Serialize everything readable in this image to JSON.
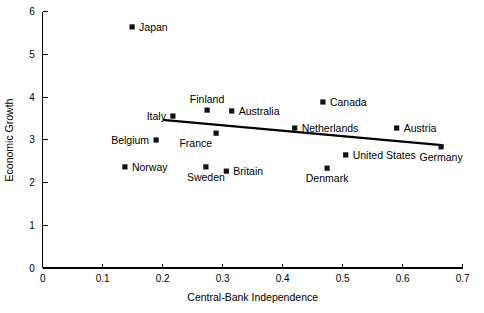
{
  "chart_data": {
    "type": "scatter",
    "title": "",
    "xlabel": "Central-Bank Independence",
    "ylabel": "Economic Growth",
    "xlim": [
      0,
      0.7
    ],
    "ylim": [
      0,
      6
    ],
    "grid": false,
    "legend": "none",
    "x_ticks": [
      "0",
      "0.1",
      "0.2",
      "0.3",
      "0.4",
      "0.5",
      "0.6",
      "0.7"
    ],
    "x_tick_values": [
      0,
      0.1,
      0.2,
      0.3,
      0.4,
      0.5,
      0.6,
      0.7
    ],
    "y_ticks": [
      "0",
      "1",
      "2",
      "3",
      "4",
      "5",
      "6"
    ],
    "y_tick_values": [
      0,
      1,
      2,
      3,
      4,
      5,
      6
    ],
    "marker_shape": "square",
    "marker_color": "#111111",
    "points": [
      {
        "label": "Japan",
        "x": 0.149,
        "y": 5.65,
        "label_pos": "right"
      },
      {
        "label": "Canada",
        "x": 0.467,
        "y": 3.89,
        "label_pos": "right"
      },
      {
        "label": "Finland",
        "x": 0.274,
        "y": 3.7,
        "label_pos": "above"
      },
      {
        "label": "Australia",
        "x": 0.315,
        "y": 3.68,
        "label_pos": "right"
      },
      {
        "label": "Italy",
        "x": 0.217,
        "y": 3.56,
        "label_pos": "left"
      },
      {
        "label": "Netherlands",
        "x": 0.42,
        "y": 3.28,
        "label_pos": "right"
      },
      {
        "label": "Austria",
        "x": 0.59,
        "y": 3.28,
        "label_pos": "right"
      },
      {
        "label": "France",
        "x": 0.289,
        "y": 3.16,
        "label_pos": "below-left"
      },
      {
        "label": "Belgium",
        "x": 0.189,
        "y": 3.0,
        "label_pos": "left"
      },
      {
        "label": "Germany",
        "x": 0.664,
        "y": 2.84,
        "label_pos": "below"
      },
      {
        "label": "United States",
        "x": 0.505,
        "y": 2.65,
        "label_pos": "right"
      },
      {
        "label": "Norway",
        "x": 0.137,
        "y": 2.37,
        "label_pos": "right"
      },
      {
        "label": "Sweden",
        "x": 0.272,
        "y": 2.37,
        "label_pos": "below"
      },
      {
        "label": "Denmark",
        "x": 0.474,
        "y": 2.34,
        "label_pos": "below"
      },
      {
        "label": "Britain",
        "x": 0.306,
        "y": 2.27,
        "label_pos": "right"
      }
    ],
    "trendline": {
      "type": "line",
      "x_start": 0.2,
      "y_start": 3.47,
      "x_end": 0.665,
      "y_end": 2.88,
      "color": "#000000"
    }
  }
}
